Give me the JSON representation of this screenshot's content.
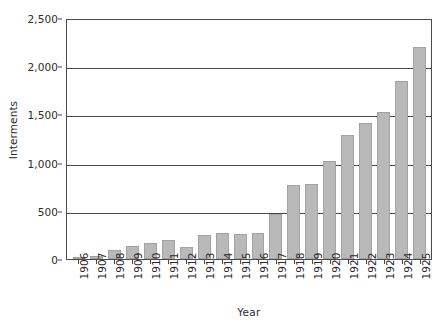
{
  "chart_data": {
    "type": "bar",
    "title": "",
    "xlabel": "Year",
    "ylabel": "Interments",
    "categories": [
      "1906",
      "1907",
      "1908",
      "1909",
      "1910",
      "1911",
      "1912",
      "1913",
      "1914",
      "1915",
      "1916",
      "1917",
      "1918",
      "1919",
      "1920",
      "1921",
      "1922",
      "1923",
      "1924",
      "1925"
    ],
    "values": [
      10,
      30,
      90,
      130,
      170,
      195,
      120,
      250,
      275,
      255,
      265,
      470,
      770,
      780,
      1020,
      1290,
      1410,
      1520,
      1850,
      2200
    ],
    "ylim": [
      0,
      2500
    ],
    "yticks": [
      0,
      500,
      1000,
      1500,
      2000,
      2500
    ],
    "ytick_labels": [
      "0",
      "500",
      "1,000",
      "1,500",
      "2,000",
      "2,500"
    ],
    "grid": true,
    "legend": "none",
    "bar_color": "#b9b9b9",
    "axis_color": "#4a4a4a",
    "background": "#ffffff"
  }
}
